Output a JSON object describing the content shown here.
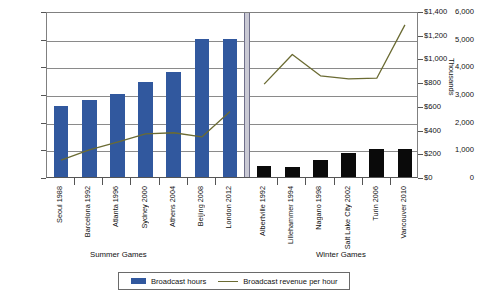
{
  "chart_data": {
    "type": "bar",
    "title": "",
    "subtitle": "",
    "xlabel": "",
    "ylabel": "",
    "y2label": "Thousands",
    "grid": true,
    "legend_position": "bottom",
    "ylim": [
      0,
      6000
    ],
    "y2lim": [
      0,
      1400
    ],
    "yticks": [
      "0",
      "1,000",
      "2,000",
      "3,000",
      "4,000",
      "5,000",
      "6,000"
    ],
    "ytick_values": [
      0,
      1000,
      2000,
      3000,
      4000,
      5000,
      6000
    ],
    "y2ticks": [
      "$0",
      "$200",
      "$400",
      "$600",
      "$800",
      "$1,000",
      "$1,200",
      "$1,400"
    ],
    "y2tick_values": [
      0,
      200,
      400,
      600,
      800,
      1000,
      1200,
      1400
    ],
    "categories": [
      "Seoul 1988",
      "Barcelona 1992",
      "Atlanta 1996",
      "Sydney 2000",
      "Athens 2004",
      "Beijing 2008",
      "London 2012",
      "Albertville 1992",
      "Lillehammer 1994",
      "Nagano 1998",
      "Salt Lake City 2002",
      "Turin 2006",
      "Vancouver 2010"
    ],
    "groups": [
      {
        "label": "Summer Games",
        "start": 0,
        "end": 6
      },
      {
        "label": "Winter Games",
        "start": 7,
        "end": 12
      }
    ],
    "series": [
      {
        "name": "Broadcast hours",
        "type": "bar",
        "axis": "left",
        "color": "#31589E",
        "color_alt": "#0a0a0a",
        "values": [
          2550,
          2800,
          3000,
          3450,
          3800,
          5000,
          5000,
          400,
          350,
          600,
          850,
          1000,
          1000
        ]
      },
      {
        "name": "Broadcast revenue per hour",
        "type": "line",
        "axis": "right",
        "color": "#6b6b33",
        "values": [
          160,
          245,
          310,
          380,
          390,
          355,
          570,
          800,
          1050,
          870,
          845,
          850,
          1300
        ]
      }
    ]
  },
  "legend": {
    "items": [
      {
        "label": "Broadcast hours",
        "marker": "bar-swatch"
      },
      {
        "label": "Broadcast revenue per hour",
        "marker": "line-swatch"
      }
    ]
  }
}
